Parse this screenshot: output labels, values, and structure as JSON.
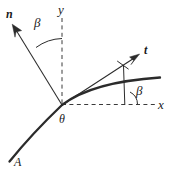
{
  "figure": {
    "kind": "vector-diagram",
    "background_color": "#ffffff",
    "stroke_color": "#1a1a1a",
    "curve_color": "#262626"
  },
  "axes": {
    "x_label": "x",
    "y_label": "y",
    "x_style": "dashed",
    "y_style": "dashed",
    "origin": {
      "x": 62,
      "y": 105
    }
  },
  "vectors": [
    {
      "name": "normal-vector",
      "label": "n",
      "bold": true,
      "tip": {
        "x": 13,
        "y": 26
      },
      "tail": {
        "x": 62,
        "y": 105
      }
    },
    {
      "name": "tangent-vector",
      "label": "t",
      "bold": true,
      "tip": {
        "x": 138,
        "y": 55
      },
      "tail": {
        "x": 62,
        "y": 105
      }
    }
  ],
  "angles": [
    {
      "name": "beta-normal",
      "label": "β",
      "between": "n-vector and y-axis"
    },
    {
      "name": "beta-tangent",
      "label": "β",
      "between": "x-axis and t-vector"
    },
    {
      "name": "theta-point",
      "label": "θ",
      "between": "point on curve at origin"
    }
  ],
  "curve": {
    "name": "surface-curve",
    "endpoint_label": "A",
    "description": "thick arc rising from lower-left to upper-right through origin"
  }
}
